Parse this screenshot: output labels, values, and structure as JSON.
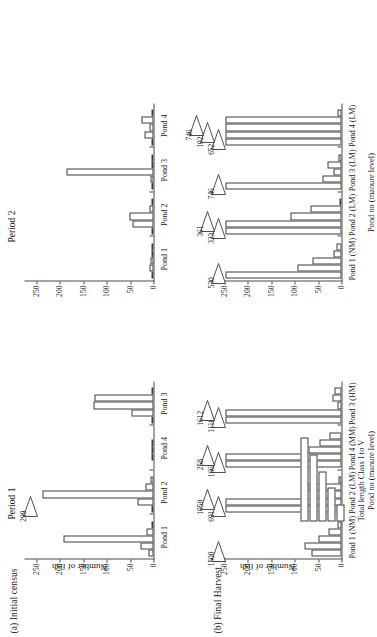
{
  "figure": {
    "orientation_note": "rotated",
    "panels": [
      {
        "tag": "(a) Initial census"
      },
      {
        "tag": "(b) Final Harvest"
      }
    ],
    "period_titles": [
      "Period 1",
      "Period 2"
    ],
    "axis_titles": {
      "y": "Number of fish",
      "x": "Pond no (manure level)"
    },
    "y_ticks": [
      "0",
      "50",
      "100",
      "150",
      "200",
      "250"
    ],
    "legend": {
      "label": "Total length Class I to V",
      "class_lengths": [
        5,
        4,
        3,
        2,
        1
      ]
    }
  },
  "chart_data": [
    {
      "id": "period1-initial-census",
      "type": "bar",
      "title": "Period 1",
      "subtitle": "(a) Initial census",
      "xlabel": "",
      "ylabel": "Number of fish",
      "ylim": [
        0,
        265
      ],
      "grid": false,
      "legend_position": "inset-bottom-right",
      "categories": [
        "Pond 1",
        "Pond 2",
        "Pond 4",
        "Pond 3"
      ],
      "class_labels": [
        "I",
        "II",
        "III",
        "IV",
        "V"
      ],
      "groups": [
        {
          "category": "Pond 1",
          "values": [
            10,
            28,
            192,
            14,
            3
          ],
          "mean_labels": []
        },
        {
          "category": "Pond 2",
          "values": [
            4,
            34,
            238,
            18,
            6
          ],
          "mean_labels": [
            "299"
          ]
        },
        {
          "category": "Pond 4",
          "values": [
            0,
            2,
            4,
            1,
            0
          ],
          "mean_labels": []
        },
        {
          "category": "Pond 3",
          "values": [
            2,
            48,
            128,
            126,
            4
          ],
          "mean_labels": []
        }
      ]
    },
    {
      "id": "period2-initial-census",
      "type": "bar",
      "title": "Period 2",
      "subtitle": "(a) Initial census",
      "xlabel": "",
      "ylabel": "Number of fish",
      "ylim": [
        0,
        265
      ],
      "grid": false,
      "categories": [
        "Pond 1",
        "Pond 2",
        "Pond 3",
        "Pond 4"
      ],
      "class_labels": [
        "I",
        "II",
        "III",
        "IV",
        "V"
      ],
      "groups": [
        {
          "category": "Pond 1",
          "values": [
            3,
            9,
            7,
            2,
            1
          ],
          "mean_labels": []
        },
        {
          "category": "Pond 2",
          "values": [
            5,
            44,
            52,
            9,
            4
          ],
          "mean_labels": []
        },
        {
          "category": "Pond 3",
          "values": [
            2,
            6,
            186,
            3,
            1
          ],
          "mean_labels": []
        },
        {
          "category": "Pond 4",
          "values": [
            4,
            20,
            9,
            26,
            3
          ],
          "mean_labels": []
        }
      ]
    },
    {
      "id": "period1-final-harvest",
      "type": "bar",
      "title": "Period 1",
      "subtitle": "(b) Final Harvest",
      "xlabel": "Pond no (manure level)",
      "ylabel": "Number of fish",
      "ylim": [
        0,
        265
      ],
      "grid": false,
      "categories": [
        "Pond 1 (NM)",
        "Pond 2 (LM)",
        "Pond 4 (MM)",
        "Pond 3 (HM)"
      ],
      "class_labels": [
        "I",
        "II",
        "III",
        "IV",
        "V"
      ],
      "groups": [
        {
          "category": "Pond 1 (NM)",
          "values": [
            65,
            80,
            50,
            28,
            8
          ],
          "mean_labels": [
            "1500"
          ]
        },
        {
          "category": "Pond 2 (LM)",
          "values": [
            248,
            248,
            60,
            72,
            6
          ],
          "mean_labels": [
            "691",
            "1050"
          ]
        },
        {
          "category": "Pond 4 (MM)",
          "values": [
            248,
            248,
            70,
            48,
            26
          ],
          "mean_labels": [
            "1665",
            "258"
          ]
        },
        {
          "category": "Pond 3 (HM)",
          "values": [
            248,
            248,
            8,
            20,
            14
          ],
          "mean_labels": [
            "1110",
            "1612"
          ]
        }
      ]
    },
    {
      "id": "period2-final-harvest",
      "type": "bar",
      "title": "Period 2",
      "subtitle": "(b) Final Harvest",
      "xlabel": "Pond no (manure level)",
      "ylabel": "Number of fish",
      "ylim": [
        0,
        265
      ],
      "grid": false,
      "categories": [
        "Pond 1 (NM)",
        "Pond 2 (LM)",
        "Pond 3 (LM)",
        "Pond 4 (LM)"
      ],
      "class_labels": [
        "I",
        "II",
        "III",
        "IV",
        "V"
      ],
      "groups": [
        {
          "category": "Pond 1 (NM)",
          "values": [
            248,
            95,
            62,
            18,
            10
          ],
          "mean_labels": [
            "530"
          ]
        },
        {
          "category": "Pond 2 (LM)",
          "values": [
            248,
            248,
            108,
            66,
            4
          ],
          "mean_labels": [
            "323",
            "361"
          ]
        },
        {
          "category": "Pond 3 (LM)",
          "values": [
            248,
            40,
            18,
            30,
            6
          ],
          "mean_labels": [
            "746"
          ]
        },
        {
          "category": "Pond 4 (LM)",
          "values": [
            248,
            248,
            248,
            248,
            9
          ],
          "mean_labels": [
            "652",
            "1022",
            "746"
          ]
        }
      ]
    }
  ]
}
